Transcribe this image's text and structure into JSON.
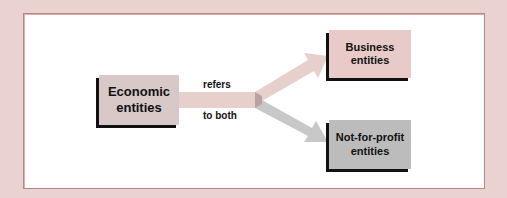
{
  "diagram": {
    "source": {
      "label_line1": "Economic",
      "label_line2": "entities"
    },
    "connector": {
      "label_top": "refers",
      "label_bottom": "to both"
    },
    "targets": [
      {
        "label_line1": "Business",
        "label_line2": "entities",
        "color": "#e8cbc8"
      },
      {
        "label_line1": "Not-for-profit",
        "label_line2": "entities",
        "color": "#bcbcbc"
      }
    ],
    "colors": {
      "background": "#e9d2cf",
      "panel": "#ffffff",
      "panel_border": "#b98682",
      "source_box": "#d8c8c8",
      "arrow_pink": "#e7cfcb",
      "arrow_gray": "#c8c8c8"
    }
  }
}
